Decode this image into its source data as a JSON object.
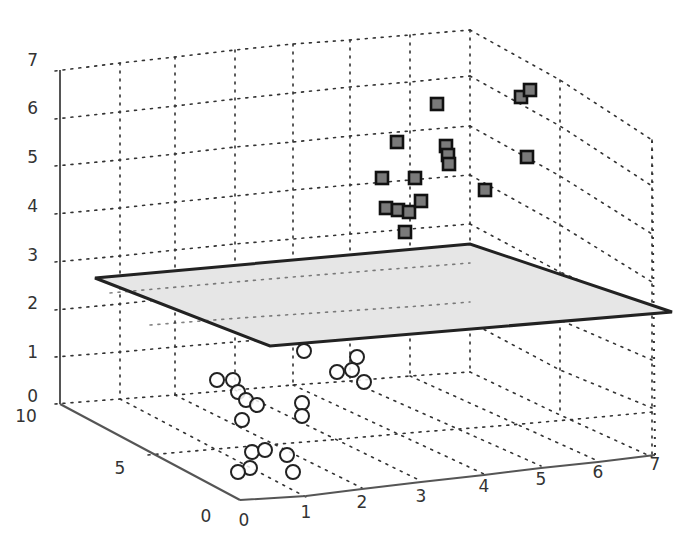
{
  "chart_data": {
    "type": "scatter3d",
    "title": "",
    "xlabel": "",
    "ylabel": "",
    "zlabel": "",
    "x_ticks": [
      "0",
      "1",
      "2",
      "3",
      "4",
      "5",
      "6",
      "7"
    ],
    "y_ticks": [
      "0",
      "5",
      "10"
    ],
    "z_ticks": [
      "0",
      "1",
      "2",
      "3",
      "4",
      "5",
      "6",
      "7"
    ],
    "xlim": [
      0,
      7
    ],
    "ylim": [
      0,
      10
    ],
    "zlim": [
      0,
      7
    ],
    "grid": true,
    "legend": null,
    "separating_plane": {
      "description": "Gray separating hyperplane between the two classes, at approximately z ≈ 2–2.5",
      "fill": "#e6e6e6",
      "edge": "#222222",
      "corners_px": [
        [
          95,
          278
        ],
        [
          470,
          244
        ],
        [
          672,
          312
        ],
        [
          270,
          346
        ]
      ]
    },
    "series": [
      {
        "name": "class-upper",
        "marker": "square",
        "color": "#7a7a7a",
        "approx_z_range": [
          3.5,
          6.5
        ],
        "points_px": [
          [
            437,
            104
          ],
          [
            397,
            142
          ],
          [
            446,
            146
          ],
          [
            382,
            178
          ],
          [
            415,
            178
          ],
          [
            448,
            155
          ],
          [
            449,
            164
          ],
          [
            386,
            208
          ],
          [
            398,
            210
          ],
          [
            409,
            212
          ],
          [
            421,
            201
          ],
          [
            405,
            232
          ],
          [
            485,
            190
          ],
          [
            527,
            157
          ],
          [
            521,
            97
          ],
          [
            530,
            90
          ]
        ]
      },
      {
        "name": "class-lower",
        "marker": "circle",
        "color": "#ffffff",
        "approx_z_range": [
          0,
          1.5
        ],
        "points_px": [
          [
            330,
            330
          ],
          [
            304,
            351
          ],
          [
            357,
            357
          ],
          [
            337,
            372
          ],
          [
            352,
            370
          ],
          [
            364,
            382
          ],
          [
            217,
            380
          ],
          [
            233,
            380
          ],
          [
            238,
            392
          ],
          [
            246,
            400
          ],
          [
            257,
            405
          ],
          [
            242,
            420
          ],
          [
            302,
            403
          ],
          [
            302,
            416
          ],
          [
            252,
            452
          ],
          [
            265,
            450
          ],
          [
            250,
            468
          ],
          [
            238,
            472
          ],
          [
            287,
            455
          ],
          [
            293,
            472
          ]
        ]
      }
    ]
  },
  "axes": {
    "z_labels": [
      {
        "text": "7",
        "x": 38,
        "y": 66
      },
      {
        "text": "6",
        "x": 38,
        "y": 114
      },
      {
        "text": "5",
        "x": 38,
        "y": 163
      },
      {
        "text": "4",
        "x": 38,
        "y": 212
      },
      {
        "text": "3",
        "x": 38,
        "y": 261
      },
      {
        "text": "2",
        "x": 38,
        "y": 309
      },
      {
        "text": "1",
        "x": 38,
        "y": 358
      },
      {
        "text": "0",
        "x": 38,
        "y": 402
      }
    ],
    "y_labels": [
      {
        "text": "10",
        "x": 26,
        "y": 422
      },
      {
        "text": "5",
        "x": 120,
        "y": 474
      },
      {
        "text": "0",
        "x": 206,
        "y": 522
      }
    ],
    "x_labels": [
      {
        "text": "0",
        "x": 244,
        "y": 526
      },
      {
        "text": "1",
        "x": 306,
        "y": 518
      },
      {
        "text": "2",
        "x": 362,
        "y": 508
      },
      {
        "text": "3",
        "x": 421,
        "y": 502
      },
      {
        "text": "4",
        "x": 484,
        "y": 492
      },
      {
        "text": "5",
        "x": 541,
        "y": 485
      },
      {
        "text": "6",
        "x": 598,
        "y": 478
      },
      {
        "text": "7",
        "x": 655,
        "y": 470
      }
    ]
  }
}
